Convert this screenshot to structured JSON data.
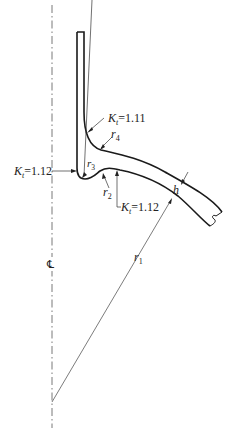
{
  "diagram": {
    "type": "engineering-cross-section",
    "colors": {
      "outline": "#1a1a1a",
      "leader": "#333333",
      "centerline": "#555555",
      "background": "#ffffff"
    },
    "labels": {
      "kt_top": {
        "symbol": "K",
        "subscript": "t",
        "value": "=1.11"
      },
      "kt_left": {
        "symbol": "K",
        "subscript": "t",
        "value": "=1.12"
      },
      "kt_bottom": {
        "symbol": "K",
        "subscript": "t",
        "value": "=1.12"
      },
      "r4": {
        "symbol": "r",
        "subscript": "4"
      },
      "r3": {
        "symbol": "r",
        "subscript": "3"
      },
      "r2": {
        "symbol": "r",
        "subscript": "2"
      },
      "r1": {
        "symbol": "r",
        "subscript": "1"
      },
      "h": {
        "symbol": "h"
      },
      "centerline": {
        "symbol": "℄"
      }
    }
  }
}
